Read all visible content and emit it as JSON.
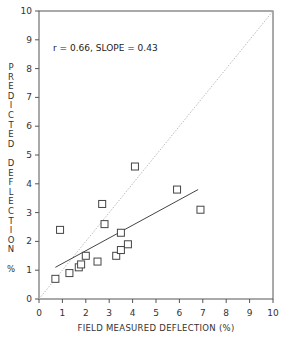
{
  "chart_data": {
    "type": "scatter",
    "title": "",
    "xlabel": "FIELD MEASURED DEFLECTION (%)",
    "ylabel": "PREDICTED DEFLECTION %",
    "xlim": [
      0,
      10
    ],
    "ylim": [
      0,
      10
    ],
    "x_ticks": [
      "0",
      "1",
      "2",
      "3",
      "4",
      "5",
      "6",
      "7",
      "8",
      "9",
      "10"
    ],
    "y_ticks": [
      "0",
      "1",
      "2",
      "3",
      "4",
      "5",
      "6",
      "7",
      "8",
      "9",
      "10"
    ],
    "grid": false,
    "legend": null,
    "annotation": "r = 0.66, SLOPE = 0.43",
    "series": [
      {
        "name": "Data points",
        "marker": "open-square",
        "points": [
          {
            "x": 0.7,
            "y": 0.7
          },
          {
            "x": 0.9,
            "y": 2.4
          },
          {
            "x": 1.3,
            "y": 0.9
          },
          {
            "x": 1.7,
            "y": 1.1
          },
          {
            "x": 1.8,
            "y": 1.2
          },
          {
            "x": 2.0,
            "y": 1.5
          },
          {
            "x": 2.5,
            "y": 1.3
          },
          {
            "x": 2.7,
            "y": 3.3
          },
          {
            "x": 2.8,
            "y": 2.6
          },
          {
            "x": 3.3,
            "y": 1.5
          },
          {
            "x": 3.5,
            "y": 1.7
          },
          {
            "x": 3.5,
            "y": 2.3
          },
          {
            "x": 3.8,
            "y": 1.9
          },
          {
            "x": 4.1,
            "y": 4.6
          },
          {
            "x": 5.9,
            "y": 3.8
          },
          {
            "x": 6.9,
            "y": 3.1
          }
        ]
      },
      {
        "name": "Regression line",
        "style": "solid",
        "points": [
          {
            "x": 0.7,
            "y": 1.1
          },
          {
            "x": 6.8,
            "y": 3.8
          }
        ]
      },
      {
        "name": "1:1 line",
        "style": "dotted",
        "points": [
          {
            "x": 0,
            "y": 0
          },
          {
            "x": 10,
            "y": 10
          }
        ]
      }
    ]
  },
  "ylabel_lines": [
    "PREDICTED",
    "DEFLECTION",
    "%"
  ],
  "caption": ""
}
